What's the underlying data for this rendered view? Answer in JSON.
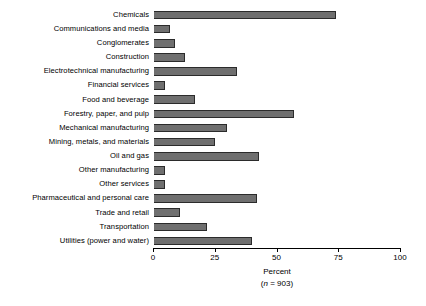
{
  "chart_data": {
    "type": "bar",
    "orientation": "horizontal",
    "title": "",
    "xlabel": "Percent",
    "xsublabel": "(n = 903)",
    "ylabel": "",
    "xlim": [
      0,
      100
    ],
    "xticks": [
      0,
      25,
      50,
      75,
      100
    ],
    "xtick_labels": [
      "0",
      "25",
      "50",
      "75",
      "100"
    ],
    "grid": false,
    "legend": null,
    "bar_color": "#6f6f6f",
    "bar_edge_color": "#2b2b2b",
    "categories": [
      "Chemicals",
      "Communications and media",
      "Conglomerates",
      "Construction",
      "Electrotechnical manufacturing",
      "Financial services",
      "Food and beverage",
      "Forestry, paper, and pulp",
      "Mechanical manufacturing",
      "Mining, metals, and materials",
      "Oil and gas",
      "Other manufacturing",
      "Other services",
      "Pharmaceutical and personal care",
      "Trade and retail",
      "Transportation",
      "Utilities (power and water)"
    ],
    "values": [
      74,
      7,
      9,
      13,
      34,
      5,
      17,
      57,
      30,
      25,
      43,
      5,
      5,
      42,
      11,
      22,
      40
    ],
    "n": 903
  },
  "axis": {
    "percent_label": "Percent",
    "sample_label_prefix": "(",
    "sample_label_n": "n",
    "sample_label_rest": " = 903)"
  }
}
